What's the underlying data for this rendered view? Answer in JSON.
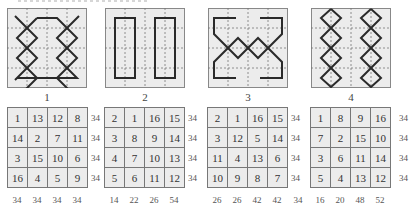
{
  "colors": {
    "grid_background": "#ececec",
    "grid_border": "#888888",
    "dotted_line": "#777777",
    "pattern_stroke": "#2a2a2a",
    "cell_border": "#777777"
  },
  "figures": [
    {
      "label": "1",
      "pattern": "interlaced chains with top and bottom bars",
      "table": [
        [
          1,
          13,
          12,
          8
        ],
        [
          14,
          2,
          7,
          11
        ],
        [
          3,
          15,
          10,
          6
        ],
        [
          16,
          4,
          5,
          9
        ]
      ],
      "row_sums": [
        "34",
        "34",
        "34",
        "34"
      ],
      "col_sums": [
        "34",
        "34",
        "34",
        "34"
      ],
      "extra_sum": null
    },
    {
      "label": "2",
      "pattern": "two vertical rectangles",
      "table": [
        [
          2,
          1,
          16,
          15
        ],
        [
          3,
          8,
          9,
          14
        ],
        [
          4,
          7,
          10,
          13
        ],
        [
          5,
          6,
          11,
          12
        ]
      ],
      "row_sums": [
        "34",
        "34",
        "34",
        "34"
      ],
      "col_sums": [
        "14",
        "22",
        "26",
        "54"
      ],
      "extra_sum": null
    },
    {
      "label": "3",
      "pattern": "brackets with horizontal diamond chain",
      "table": [
        [
          2,
          1,
          16,
          15
        ],
        [
          3,
          12,
          5,
          14
        ],
        [
          11,
          4,
          13,
          6
        ],
        [
          10,
          9,
          8,
          7
        ]
      ],
      "row_sums": [
        "34",
        "34",
        "34",
        "34"
      ],
      "col_sums": [
        "26",
        "26",
        "42",
        "42"
      ],
      "extra_sum": "34"
    },
    {
      "label": "4",
      "pattern": "two vertical diamond chains",
      "table": [
        [
          1,
          8,
          9,
          16
        ],
        [
          7,
          2,
          15,
          10
        ],
        [
          3,
          6,
          11,
          14
        ],
        [
          5,
          4,
          13,
          12
        ]
      ],
      "row_sums": [
        "34",
        "34",
        "34",
        "34"
      ],
      "col_sums": [
        "16",
        "20",
        "48",
        "52"
      ],
      "extra_sum": null
    }
  ]
}
